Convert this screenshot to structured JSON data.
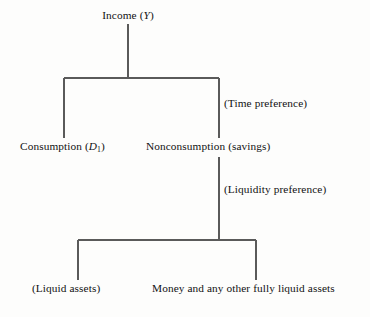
{
  "diagram": {
    "type": "tree",
    "orientation": "top-down",
    "background_color": "#fdfdfc",
    "line_color": "#5a5a5a",
    "text_color": "#121212",
    "nodes": [
      {
        "id": "income",
        "text": "Income (Y)",
        "text_plain": "Income",
        "symbol": "Y",
        "symbol_style": "italic",
        "level": 0,
        "x": 128,
        "y": 14,
        "align": "center"
      },
      {
        "id": "consumption",
        "text": "Consumption (D1)",
        "text_plain": "Consumption",
        "symbol": "D",
        "symbol_subscript": "1",
        "symbol_style": "italic",
        "level": 1,
        "x": 20,
        "y": 144,
        "align": "left"
      },
      {
        "id": "nonconsumption",
        "text": "Nonconsumption (savings)",
        "text_plain": "Nonconsumption (savings)",
        "level": 1,
        "x": 146,
        "y": 144,
        "align": "left"
      },
      {
        "id": "liquid-assets",
        "text": "(Liquid assets)",
        "text_plain": "(Liquid assets)",
        "level": 2,
        "x": 32,
        "y": 286,
        "align": "left"
      },
      {
        "id": "money-liquid",
        "text": "Money and any other fully liquid assets",
        "text_plain": "Money and any other fully liquid assets",
        "level": 2,
        "x": 152,
        "y": 286,
        "align": "left"
      }
    ],
    "edge_labels": [
      {
        "id": "time-preference",
        "text": "(Time preference)",
        "x": 224,
        "y": 101,
        "attached_to_edge": "income-to-nonconsumption"
      },
      {
        "id": "liquidity-preference",
        "text": "(Liquidity preference)",
        "x": 224,
        "y": 187,
        "attached_to_edge": "nonconsumption-to-assets"
      }
    ],
    "edges": [
      {
        "id": "income-stem",
        "from": "income",
        "to": "bracket-1",
        "path": "M128,24 L128,78"
      },
      {
        "id": "bracket-1-bar",
        "from": "bracket-1-left",
        "to": "bracket-1-right",
        "path": "M64,78 L219,78"
      },
      {
        "id": "bracket-1-left-drop",
        "from": "bracket-1",
        "to": "consumption",
        "path": "M64,78 L64,138"
      },
      {
        "id": "bracket-1-right-drop",
        "from": "bracket-1",
        "to": "nonconsumption",
        "path": "M219,78 L219,138"
      },
      {
        "id": "nonconsumption-stem",
        "from": "nonconsumption",
        "to": "bracket-2",
        "path": "M219,157 L219,240"
      },
      {
        "id": "bracket-2-bar",
        "from": "bracket-2-left",
        "to": "bracket-2-right",
        "path": "M78,240 L256,240"
      },
      {
        "id": "bracket-2-left-drop",
        "from": "bracket-2",
        "to": "liquid-assets",
        "path": "M78,240 L78,280"
      },
      {
        "id": "bracket-2-right-drop",
        "from": "bracket-2",
        "to": "money-liquid",
        "path": "M256,240 L256,280"
      }
    ]
  }
}
